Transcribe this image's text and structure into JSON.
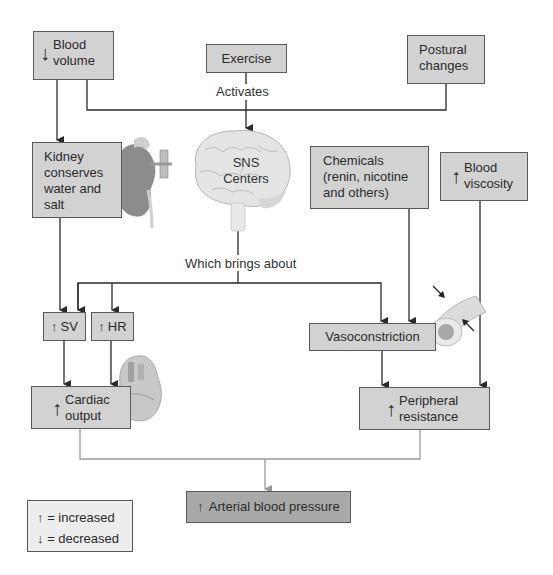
{
  "nodes": {
    "blood_volume": {
      "arrow": "↓",
      "line1": "Blood",
      "line2": "volume"
    },
    "exercise": {
      "label": "Exercise"
    },
    "postural_changes": {
      "line1": "Postural",
      "line2": "changes"
    },
    "kidney": {
      "lines": [
        "Kidney",
        "conserves",
        "water and",
        "salt"
      ]
    },
    "sns": {
      "line1": "SNS",
      "line2": "Centers"
    },
    "chemicals": {
      "lines": [
        "Chemicals",
        "(renin, nicotine",
        "and others)"
      ]
    },
    "blood_viscosity": {
      "arrow": "↑",
      "line1": "Blood",
      "line2": "viscosity"
    },
    "sv": {
      "arrow": "↑",
      "label": "SV"
    },
    "hr": {
      "arrow": "↑",
      "label": "HR"
    },
    "vasoconstriction": {
      "label": "Vasoconstriction"
    },
    "cardiac_output": {
      "arrow": "↑",
      "line1": "Cardiac",
      "line2": "output"
    },
    "peripheral_resistance": {
      "arrow": "↑",
      "line1": "Peripheral",
      "line2": "resistance"
    },
    "arterial_bp": {
      "arrow": "↑",
      "label": "Arterial blood pressure"
    }
  },
  "connector_labels": {
    "activates": "Activates",
    "which_brings_about": "Which brings about"
  },
  "legend": {
    "increased_symbol": "↑",
    "increased_label": "= increased",
    "decreased_symbol": "↓",
    "decreased_label": "= decreased"
  },
  "colors": {
    "box_fill": "#d2d2d2",
    "result_box_fill": "#a9a9a9",
    "legend_fill": "#ededed",
    "line": "#2a2a2a",
    "bottom_line": "#9a9a9a"
  }
}
